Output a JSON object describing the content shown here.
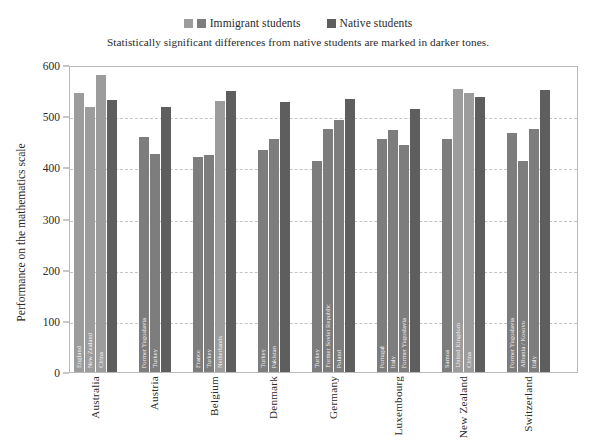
{
  "legend": {
    "items": [
      {
        "label": "Immigrant students",
        "swatches": [
          "#9c9c9c",
          "#7d7d7d"
        ]
      },
      {
        "label": "Native students",
        "swatches": [
          "#5e5e5e"
        ]
      }
    ]
  },
  "subtitle": "Statistically significant differences from native students are marked in darker tones.",
  "axis": {
    "y_title": "Performance on the mathematics scale",
    "y_ticks": [
      "0",
      "100",
      "200",
      "300",
      "400",
      "500",
      "600"
    ]
  },
  "colors": {
    "immigrant_light": "#9c9c9c",
    "immigrant_dark": "#7d7d7d",
    "native": "#5e5e5e",
    "gridline": "#c3c3c3",
    "frame": "#b9b9b9"
  },
  "chart_data": {
    "type": "bar",
    "title": "",
    "subtitle": "Statistically significant differences from native students are marked in darker tones.",
    "xlabel": "",
    "ylabel": "Performance on the mathematics scale",
    "ylim": [
      0,
      600
    ],
    "ytick_step": 100,
    "grid": true,
    "legend_position": "top-center",
    "categories": [
      "Australia",
      "Austria",
      "Belgium",
      "Denmark",
      "Germany",
      "Luxembourg",
      "New Zealand",
      "Switzerland"
    ],
    "groups": [
      {
        "country": "Australia",
        "bars": [
          {
            "label": "England",
            "value": 545,
            "series": "immigrant",
            "significant": false
          },
          {
            "label": "New Zealand",
            "value": 518,
            "series": "immigrant",
            "significant": false
          },
          {
            "label": "China",
            "value": 580,
            "series": "immigrant",
            "significant": false
          },
          {
            "label": "",
            "value": 532,
            "series": "native",
            "significant": false
          }
        ]
      },
      {
        "country": "Austria",
        "bars": [
          {
            "label": "Former Yugoslavia",
            "value": 460,
            "series": "immigrant",
            "significant": true
          },
          {
            "label": "Turkey",
            "value": 426,
            "series": "immigrant",
            "significant": true
          },
          {
            "label": "",
            "value": 518,
            "series": "native",
            "significant": false
          }
        ]
      },
      {
        "country": "Belgium",
        "bars": [
          {
            "label": "France",
            "value": 421,
            "series": "immigrant",
            "significant": true
          },
          {
            "label": "Turkey",
            "value": 424,
            "series": "immigrant",
            "significant": true
          },
          {
            "label": "Netherlands",
            "value": 530,
            "series": "immigrant",
            "significant": false
          },
          {
            "label": "",
            "value": 550,
            "series": "native",
            "significant": false
          }
        ]
      },
      {
        "country": "Denmark",
        "bars": [
          {
            "label": "Turkey",
            "value": 433,
            "series": "immigrant",
            "significant": true
          },
          {
            "label": "Pakistan",
            "value": 455,
            "series": "immigrant",
            "significant": true
          },
          {
            "label": "",
            "value": 528,
            "series": "native",
            "significant": false
          }
        ]
      },
      {
        "country": "Germany",
        "bars": [
          {
            "label": "Turkey",
            "value": 412,
            "series": "immigrant",
            "significant": true
          },
          {
            "label": "Former Soviet Republic",
            "value": 475,
            "series": "immigrant",
            "significant": true
          },
          {
            "label": "Poland",
            "value": 492,
            "series": "immigrant",
            "significant": true
          },
          {
            "label": "",
            "value": 533,
            "series": "native",
            "significant": false
          }
        ]
      },
      {
        "country": "Luxembourg",
        "bars": [
          {
            "label": "Portugal",
            "value": 455,
            "series": "immigrant",
            "significant": true
          },
          {
            "label": "Italy",
            "value": 473,
            "series": "immigrant",
            "significant": true
          },
          {
            "label": "Former Yugoslavia",
            "value": 443,
            "series": "immigrant",
            "significant": true
          },
          {
            "label": "",
            "value": 514,
            "series": "native",
            "significant": false
          }
        ]
      },
      {
        "country": "New Zealand",
        "bars": [
          {
            "label": "Samoa",
            "value": 456,
            "series": "immigrant",
            "significant": true
          },
          {
            "label": "United Kingdom",
            "value": 553,
            "series": "immigrant",
            "significant": false
          },
          {
            "label": "China",
            "value": 545,
            "series": "immigrant",
            "significant": false
          },
          {
            "label": "",
            "value": 538,
            "series": "native",
            "significant": false
          }
        ]
      },
      {
        "country": "Switzerland",
        "bars": [
          {
            "label": "Former Yugoslavia",
            "value": 468,
            "series": "immigrant",
            "significant": true
          },
          {
            "label": "Albania / Kosovo",
            "value": 413,
            "series": "immigrant",
            "significant": true
          },
          {
            "label": "Italy",
            "value": 474,
            "series": "immigrant",
            "significant": true
          },
          {
            "label": "",
            "value": 552,
            "series": "native",
            "significant": false
          }
        ]
      }
    ]
  }
}
